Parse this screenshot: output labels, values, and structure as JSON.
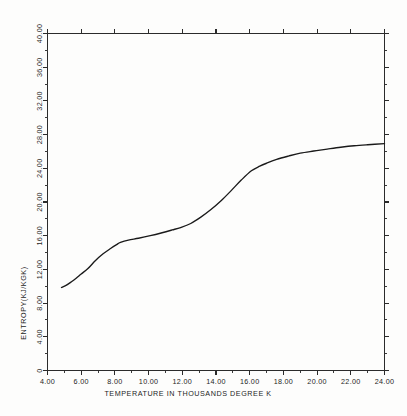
{
  "chart_data": {
    "type": "line",
    "title": "",
    "xlabel": "TEMPERATURE IN THOUSANDS DEGREE K",
    "ylabel": "ENTROPY(KJ/KGK)",
    "xlim": [
      4.0,
      24.0
    ],
    "ylim": [
      0.0,
      40.0
    ],
    "grid": false,
    "legend": null,
    "x_ticks": [
      "4.00",
      "6.00",
      "8.00",
      "10.00",
      "12.00",
      "14.00",
      "16.00",
      "18.00",
      "20.00",
      "22.00",
      "24.00"
    ],
    "x_tick_values": [
      4,
      6,
      8,
      10,
      12,
      14,
      16,
      18,
      20,
      22,
      24
    ],
    "y_ticks": [
      "0",
      "4.00",
      "8.00",
      "12.00",
      "16.00",
      "20.00",
      "24.00",
      "28.00",
      "32.00",
      "36.00",
      "40.00"
    ],
    "y_tick_values": [
      0,
      4,
      8,
      12,
      16,
      20,
      24,
      28,
      32,
      36,
      40
    ],
    "x": [
      4.83,
      5.1,
      5.4,
      5.7,
      6.0,
      6.4,
      6.85,
      7.3,
      7.74,
      8.1,
      8.33,
      8.8,
      9.4,
      10.1,
      10.8,
      11.4,
      11.9,
      12.5,
      13.1,
      13.7,
      14.3,
      14.9,
      15.5,
      16.1,
      16.6,
      17.0,
      17.6,
      18.3,
      19.0,
      19.8,
      20.6,
      21.4,
      22.2,
      23.0,
      24.0
    ],
    "y": [
      9.85,
      10.1,
      10.5,
      10.95,
      11.45,
      12.1,
      13.06,
      13.85,
      14.48,
      14.95,
      15.2,
      15.48,
      15.7,
      16.0,
      16.35,
      16.68,
      16.97,
      17.45,
      18.2,
      19.1,
      20.15,
      21.35,
      22.6,
      23.7,
      24.25,
      24.6,
      25.05,
      25.45,
      25.8,
      26.05,
      26.28,
      26.5,
      26.68,
      26.8,
      26.92
    ],
    "series": [
      {
        "name": "entropy",
        "x": [
          4.83,
          5.1,
          5.4,
          5.7,
          6.0,
          6.4,
          6.85,
          7.3,
          7.74,
          8.1,
          8.33,
          8.8,
          9.4,
          10.1,
          10.8,
          11.4,
          11.9,
          12.5,
          13.1,
          13.7,
          14.3,
          14.9,
          15.5,
          16.1,
          16.6,
          17.0,
          17.6,
          18.3,
          19.0,
          19.8,
          20.6,
          21.4,
          22.2,
          23.0,
          24.0
        ],
        "y": [
          9.85,
          10.1,
          10.5,
          10.95,
          11.45,
          12.1,
          13.06,
          13.85,
          14.48,
          14.95,
          15.2,
          15.48,
          15.7,
          16.0,
          16.35,
          16.68,
          16.97,
          17.45,
          18.2,
          19.1,
          20.15,
          21.35,
          22.6,
          23.7,
          24.25,
          24.6,
          25.05,
          25.45,
          25.8,
          26.05,
          26.28,
          26.5,
          26.68,
          26.8,
          26.92
        ],
        "color": "#1a1a1a"
      }
    ]
  },
  "style": {
    "background": "#fdfdfc",
    "axis_color": "#2b2b2b",
    "curve_color": "#1a1a1a",
    "text_color": "#1d1d1d"
  }
}
